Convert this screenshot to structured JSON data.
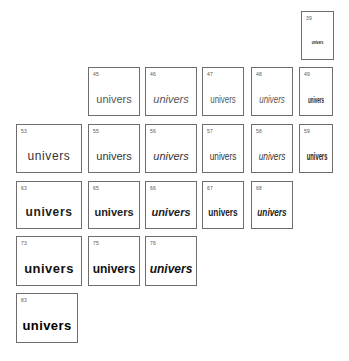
{
  "chart_title": "Univers type family grid",
  "sample_word": "univers",
  "cells": [
    {
      "id": "39",
      "label": "39",
      "text": "univers",
      "weight": 300,
      "italic": false,
      "width": "ultra-condensed"
    },
    {
      "id": "45",
      "label": "45",
      "text": "univers",
      "weight": 300,
      "italic": false,
      "width": "normal"
    },
    {
      "id": "46",
      "label": "46",
      "text": "univers",
      "weight": 300,
      "italic": true,
      "width": "normal"
    },
    {
      "id": "47",
      "label": "47",
      "text": "univers",
      "weight": 300,
      "italic": false,
      "width": "condensed"
    },
    {
      "id": "48",
      "label": "48",
      "text": "univers",
      "weight": 300,
      "italic": true,
      "width": "condensed"
    },
    {
      "id": "49",
      "label": "49",
      "text": "univers",
      "weight": 400,
      "italic": false,
      "width": "extra-condensed"
    },
    {
      "id": "53",
      "label": "53",
      "text": "univers",
      "weight": 400,
      "italic": false,
      "width": "extended"
    },
    {
      "id": "55",
      "label": "55",
      "text": "univers",
      "weight": 400,
      "italic": false,
      "width": "normal"
    },
    {
      "id": "56",
      "label": "56",
      "text": "univers",
      "weight": 400,
      "italic": true,
      "width": "normal"
    },
    {
      "id": "57",
      "label": "57",
      "text": "univers",
      "weight": 400,
      "italic": false,
      "width": "condensed"
    },
    {
      "id": "58",
      "label": "58",
      "text": "univers",
      "weight": 400,
      "italic": true,
      "width": "condensed"
    },
    {
      "id": "59",
      "label": "59",
      "text": "univers",
      "weight": 500,
      "italic": false,
      "width": "extra-condensed"
    },
    {
      "id": "63",
      "label": "63",
      "text": "univers",
      "weight": 600,
      "italic": false,
      "width": "extended"
    },
    {
      "id": "65",
      "label": "65",
      "text": "univers",
      "weight": 600,
      "italic": false,
      "width": "normal"
    },
    {
      "id": "66",
      "label": "66",
      "text": "univers",
      "weight": 600,
      "italic": true,
      "width": "normal"
    },
    {
      "id": "67",
      "label": "67",
      "text": "univers",
      "weight": 600,
      "italic": false,
      "width": "condensed"
    },
    {
      "id": "68",
      "label": "68",
      "text": "univers",
      "weight": 600,
      "italic": true,
      "width": "condensed"
    },
    {
      "id": "73",
      "label": "73",
      "text": "univers",
      "weight": 800,
      "italic": false,
      "width": "extended"
    },
    {
      "id": "75",
      "label": "75",
      "text": "univers",
      "weight": 800,
      "italic": false,
      "width": "normal"
    },
    {
      "id": "76",
      "label": "76",
      "text": "univers",
      "weight": 800,
      "italic": true,
      "width": "normal"
    },
    {
      "id": "83",
      "label": "83",
      "text": "univers",
      "weight": 900,
      "italic": false,
      "width": "extended"
    }
  ]
}
